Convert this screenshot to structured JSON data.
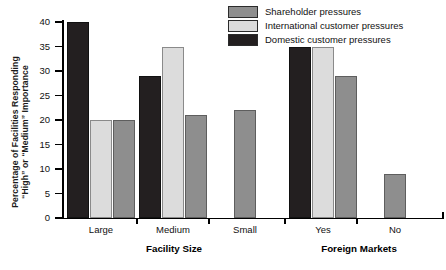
{
  "chart_data": {
    "type": "bar",
    "title": "",
    "xlabel": "",
    "ylabel": "Percentage of Facilities Responding \"High\" or \"Medium\" Importance",
    "ylabel_lines": [
      "Percentage of Facilities Responding",
      "“High” or “Medium” Importance"
    ],
    "ylim": [
      0,
      40
    ],
    "yticks": [
      0,
      5,
      10,
      15,
      20,
      25,
      30,
      35,
      40
    ],
    "ytick_labels": [
      "0",
      "5",
      "10",
      "15",
      "20",
      "25",
      "30",
      "35",
      "40"
    ],
    "grid": false,
    "legend_position": "top-right",
    "categories": [
      "Large",
      "Medium",
      "Small",
      "Yes",
      "No"
    ],
    "group_labels": [
      {
        "label": "Facility Size",
        "categories": [
          "Large",
          "Medium",
          "Small"
        ]
      },
      {
        "label": "Foreign Markets",
        "categories": [
          "Yes",
          "No"
        ]
      }
    ],
    "series": [
      {
        "name": "Domestic customer pressures",
        "color": "#231f20",
        "values": [
          40,
          29,
          null,
          35,
          null
        ]
      },
      {
        "name": "International customer pressures",
        "color": "#dcdcdc",
        "values": [
          20,
          35,
          null,
          35,
          null
        ]
      },
      {
        "name": "Shareholder pressures",
        "color": "#8e8e8e",
        "values": [
          20,
          21,
          22,
          29,
          9
        ]
      }
    ]
  },
  "legend": {
    "items": [
      {
        "label": "Shareholder pressures",
        "color": "#8e8e8e"
      },
      {
        "label": "International customer pressures",
        "color": "#dcdcdc"
      },
      {
        "label": "Domestic customer pressures",
        "color": "#231f20"
      }
    ]
  },
  "axes": {
    "y_title_line1": "Percentage of Facilities Responding",
    "y_title_line2": "“High” or “Medium” Importance",
    "y_ticks": [
      "0",
      "5",
      "10",
      "15",
      "20",
      "25",
      "30",
      "35",
      "40"
    ],
    "x_categories": [
      "Large",
      "Medium",
      "Small",
      "Yes",
      "No"
    ],
    "x_group_left": "Facility Size",
    "x_group_right": "Foreign Markets"
  }
}
